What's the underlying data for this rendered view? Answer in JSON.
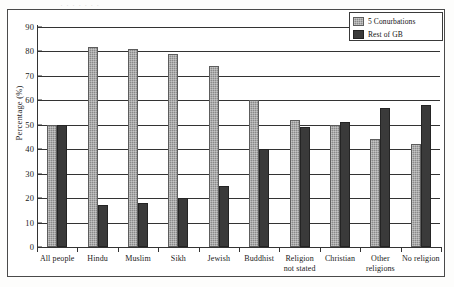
{
  "chart_data": {
    "type": "bar",
    "title": "",
    "xlabel": "",
    "ylabel": "Percentage (%)",
    "ylim": [
      0,
      90
    ],
    "ytick_step": 10,
    "yticks": [
      0,
      10,
      20,
      30,
      40,
      50,
      60,
      70,
      80,
      90
    ],
    "grid": true,
    "legend_position": "top-right",
    "categories": [
      "All people",
      "Hindu",
      "Muslim",
      "Sikh",
      "Jewish",
      "Buddhist",
      "Religion not stated",
      "Christian",
      "Other religions",
      "No religion"
    ],
    "category_lines": [
      [
        "All people",
        ""
      ],
      [
        "Hindu",
        ""
      ],
      [
        "Muslim",
        ""
      ],
      [
        "Sikh",
        ""
      ],
      [
        "Jewish",
        ""
      ],
      [
        "Buddhist",
        ""
      ],
      [
        "Religion",
        "not stated"
      ],
      [
        "Christian",
        ""
      ],
      [
        "Other",
        "religions"
      ],
      [
        "No religion",
        ""
      ]
    ],
    "series": [
      {
        "name": "5 Conurbations",
        "color": "#8a8a8a",
        "values": [
          50,
          82,
          81,
          79,
          74,
          60,
          52,
          50,
          44,
          42
        ]
      },
      {
        "name": "Rest of GB",
        "color": "#3a3a3a",
        "values": [
          50,
          17,
          18,
          20,
          25,
          40,
          49,
          51,
          57,
          58
        ]
      }
    ]
  },
  "legend": {
    "items": [
      {
        "label": "5 Conurbations"
      },
      {
        "label": "Rest of GB"
      }
    ]
  },
  "axes": {
    "y_title": "Percentage (%)"
  },
  "artifacts": {
    "top_sliver_text": "·  ·  ·      ·   ·           ·        ·"
  },
  "colors": {
    "series_light": "#8a8a8a",
    "series_dark": "#3a3a3a",
    "axis": "#333333",
    "frame": "#4a4a4a",
    "background": "#ffffff"
  }
}
